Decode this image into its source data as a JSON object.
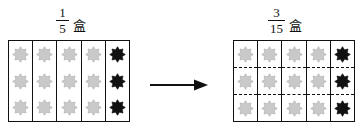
{
  "diagram": {
    "type": "equivalent-fractions-area-model",
    "left": {
      "label": {
        "numerator": "1",
        "denominator": "5",
        "unit": "盒"
      },
      "grid": {
        "columns": 5,
        "rows": 3,
        "row_dividers": false,
        "shaded_columns": 1,
        "total_items": 15,
        "shaded_items": 3
      }
    },
    "right": {
      "label": {
        "numerator": "3",
        "denominator": "15",
        "unit": "盒"
      },
      "grid": {
        "columns": 5,
        "rows": 3,
        "row_dividers": true,
        "shaded_columns": 1,
        "total_items": 15,
        "shaded_items": 3
      }
    },
    "connector": {
      "icon": "right-arrow-icon"
    },
    "colors": {
      "outline": "#111111",
      "item_unshaded": "#c9c9c9",
      "item_unshaded_stroke": "#b0b0b0",
      "item_shaded": "#111111",
      "background": "#ffffff"
    }
  }
}
